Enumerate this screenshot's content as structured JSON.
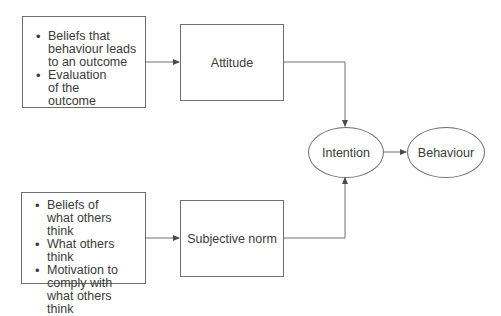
{
  "diagram": {
    "attitude_inputs": {
      "items": [
        "Beliefs that behaviour leads to an outcome",
        "Evaluation of the outcome"
      ]
    },
    "norm_inputs": {
      "items": [
        "Beliefs of what others think",
        "What others think",
        "Motivation to comply with what others think"
      ]
    },
    "attitude": {
      "label": "Attitude"
    },
    "subjective_norm": {
      "label": "Subjective norm"
    },
    "intention": {
      "label": "Intention"
    },
    "behaviour": {
      "label": "Behaviour"
    },
    "edges": [
      {
        "from": "attitude_inputs",
        "to": "attitude"
      },
      {
        "from": "norm_inputs",
        "to": "subjective_norm"
      },
      {
        "from": "attitude",
        "to": "intention"
      },
      {
        "from": "subjective_norm",
        "to": "intention"
      },
      {
        "from": "intention",
        "to": "behaviour"
      }
    ],
    "colors": {
      "line": "#6e6e6e",
      "text": "#3a3a3a",
      "background": "#ffffff"
    }
  }
}
